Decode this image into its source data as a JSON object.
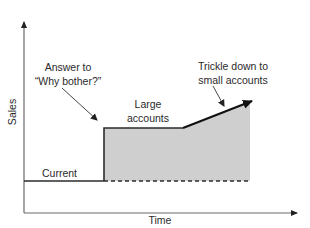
{
  "diagram": {
    "type": "sales-over-time-step-diagram",
    "axes": {
      "x_label": "Time",
      "y_label": "Sales"
    },
    "labels": {
      "current": "Current",
      "large_accounts": [
        "Large",
        "accounts"
      ],
      "answer_callout": [
        "Answer to",
        "“Why bother?”"
      ],
      "trickle_callout": [
        "Trickle down to",
        "small accounts"
      ]
    },
    "colors": {
      "line": "#2b2b2b",
      "axis": "#6a6a6a",
      "fill": "#cfcfcf",
      "text": "#2a2a2a"
    }
  }
}
